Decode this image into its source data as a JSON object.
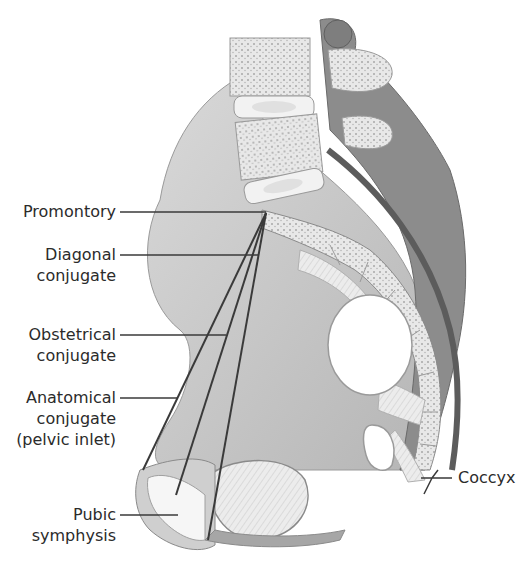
{
  "figure": {
    "labels": {
      "promontory": "Promontory",
      "diagonal_conjugate": [
        "Diagonal",
        "conjugate"
      ],
      "obstetrical_conjugate": [
        "Obstetrical",
        "conjugate"
      ],
      "anatomical_conjugate": [
        "Anatomical",
        "conjugate",
        "(pelvic inlet)"
      ],
      "pubic_symphysis": [
        "Pubic",
        "symphysis"
      ],
      "coccyx": "Coccyx"
    },
    "colors": {
      "line": "#3a3a3a",
      "bone_light": "#e4e4e4",
      "bone_mid": "#bdbdbd",
      "bone_dark": "#7a7a7a",
      "text": "#2b2b2b"
    }
  }
}
